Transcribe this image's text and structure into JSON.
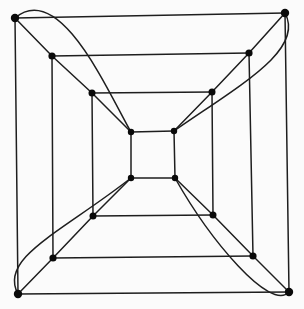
{
  "figure": {
    "type": "graph-diagram",
    "background": "#fbfbfb",
    "edge_color": "#1e1e1e",
    "node_color": "#0a0a0a",
    "edge_width": 1.5,
    "canvas": {
      "width": 304,
      "height": 309
    },
    "nodes": [
      {
        "id": "o_tl",
        "x": 15,
        "y": 18,
        "r": 4.2
      },
      {
        "id": "o_tr",
        "x": 285,
        "y": 13,
        "r": 4.2
      },
      {
        "id": "o_br",
        "x": 289,
        "y": 292,
        "r": 4.2
      },
      {
        "id": "o_bl",
        "x": 18,
        "y": 294,
        "r": 4.2
      },
      {
        "id": "s_tl",
        "x": 52,
        "y": 56,
        "r": 3.6
      },
      {
        "id": "s_tr",
        "x": 249,
        "y": 53,
        "r": 3.6
      },
      {
        "id": "s_br",
        "x": 253,
        "y": 256,
        "r": 3.6
      },
      {
        "id": "s_bl",
        "x": 53,
        "y": 258,
        "r": 3.6
      },
      {
        "id": "t_tl",
        "x": 92,
        "y": 93,
        "r": 3.5
      },
      {
        "id": "t_tr",
        "x": 212,
        "y": 92,
        "r": 3.5
      },
      {
        "id": "t_br",
        "x": 213,
        "y": 215,
        "r": 3.5
      },
      {
        "id": "t_bl",
        "x": 93,
        "y": 216,
        "r": 3.5
      },
      {
        "id": "i_tl",
        "x": 131,
        "y": 132,
        "r": 3.2
      },
      {
        "id": "i_tr",
        "x": 174,
        "y": 131,
        "r": 3.2
      },
      {
        "id": "i_br",
        "x": 175,
        "y": 178,
        "r": 3.2
      },
      {
        "id": "i_bl",
        "x": 131,
        "y": 178,
        "r": 3.2
      }
    ],
    "straight_edges": [
      [
        "o_tl",
        "o_tr"
      ],
      [
        "o_tr",
        "o_br"
      ],
      [
        "o_br",
        "o_bl"
      ],
      [
        "o_bl",
        "o_tl"
      ],
      [
        "s_tl",
        "s_tr"
      ],
      [
        "s_tr",
        "s_br"
      ],
      [
        "s_br",
        "s_bl"
      ],
      [
        "s_bl",
        "s_tl"
      ],
      [
        "t_tl",
        "t_tr"
      ],
      [
        "t_tr",
        "t_br"
      ],
      [
        "t_br",
        "t_bl"
      ],
      [
        "t_bl",
        "t_tl"
      ],
      [
        "i_tl",
        "i_tr"
      ],
      [
        "i_tr",
        "i_br"
      ],
      [
        "i_br",
        "i_bl"
      ],
      [
        "i_bl",
        "i_tl"
      ],
      [
        "o_tl",
        "s_tl"
      ],
      [
        "s_tl",
        "t_tl"
      ],
      [
        "t_tl",
        "i_tl"
      ],
      [
        "o_tr",
        "s_tr"
      ],
      [
        "s_tr",
        "t_tr"
      ],
      [
        "t_tr",
        "i_tr"
      ],
      [
        "o_br",
        "s_br"
      ],
      [
        "s_br",
        "t_br"
      ],
      [
        "t_br",
        "i_br"
      ],
      [
        "o_bl",
        "s_bl"
      ],
      [
        "s_bl",
        "t_bl"
      ],
      [
        "t_bl",
        "i_bl"
      ]
    ],
    "curved_edges": [
      {
        "from": "o_tl",
        "to": "i_tl",
        "c1": [
          60,
          -20
        ],
        "c2": [
          108,
          92
        ]
      },
      {
        "from": "o_tr",
        "to": "i_tr",
        "c1": [
          305,
          50
        ],
        "c2": [
          240,
          85
        ]
      },
      {
        "from": "o_br",
        "to": "i_br",
        "c1": [
          270,
          312
        ],
        "c2": [
          210,
          240
        ]
      },
      {
        "from": "o_bl",
        "to": "i_bl",
        "c1": [
          -2,
          258
        ],
        "c2": [
          62,
          232
        ]
      }
    ]
  }
}
